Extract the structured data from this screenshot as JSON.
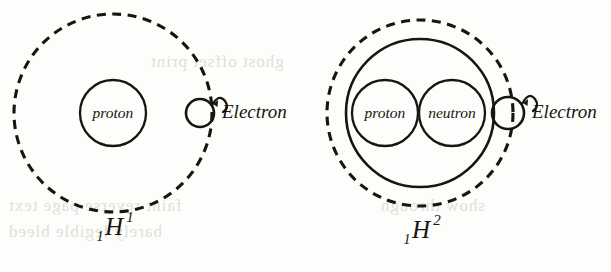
{
  "figure": {
    "type": "atomic-structure-diagram",
    "ink_color": "#17150f",
    "paper_color": "#fdfdfb"
  },
  "atoms": [
    {
      "id": "protium",
      "isotope": {
        "mass_number": "1",
        "symbol": "H",
        "atomic_number": "1"
      },
      "orbit": {
        "style": "dashed",
        "cx": 113,
        "cy": 113,
        "r": 99
      },
      "nucleus": {
        "style": "none",
        "cx": 113,
        "cy": 113,
        "r": 0
      },
      "particles": [
        {
          "label": "proton",
          "cx": 113,
          "cy": 113,
          "r": 33
        }
      ],
      "electron": {
        "label": "Electron",
        "cx": 200,
        "cy": 113,
        "r": 14,
        "spin": true
      },
      "electron_label_x": 222,
      "electron_label_y": 114,
      "caption_x": 113,
      "caption_y": 232
    },
    {
      "id": "deuterium",
      "isotope": {
        "mass_number": "2",
        "symbol": "H",
        "atomic_number": "1"
      },
      "orbit": {
        "style": "dashed",
        "cx": 420,
        "cy": 113,
        "r": 93
      },
      "nucleus": {
        "style": "solid",
        "cx": 420,
        "cy": 113,
        "r": 74
      },
      "particles": [
        {
          "label": "proton",
          "cx": 385,
          "cy": 113,
          "r": 33
        },
        {
          "label": "neutron",
          "cx": 452,
          "cy": 113,
          "r": 33
        }
      ],
      "electron": {
        "label": "Electron",
        "cx": 508,
        "cy": 113,
        "r": 16,
        "spin": true
      },
      "electron_label_x": 532,
      "electron_label_y": 114,
      "caption_x": 420,
      "caption_y": 235
    }
  ],
  "ghost_text": {
    "line1": "ghost offset print",
    "line2": "faint reverse page text",
    "line3": "barely legible bleed",
    "line4": "show through"
  }
}
